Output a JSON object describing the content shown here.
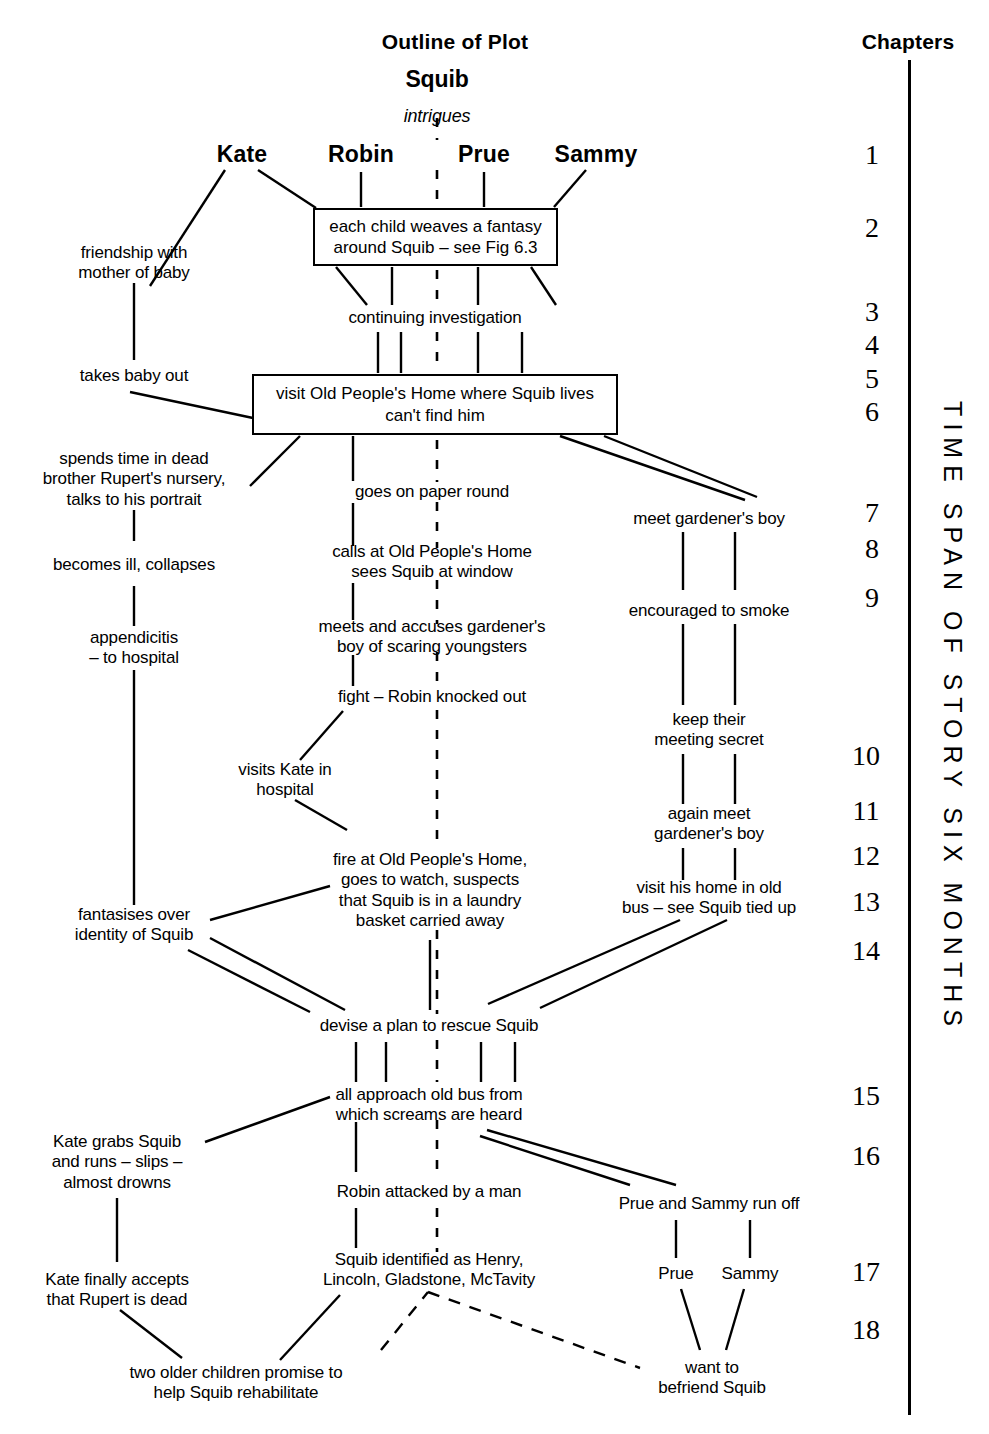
{
  "figure": {
    "title": "Outline of Plot",
    "chapters_heading": "Chapters",
    "central_character": "Squib",
    "central_relation": "intrigues",
    "timespan_label": "TIME SPAN OF STORY SIX MONTHS"
  },
  "characters": [
    {
      "name": "Kate",
      "x": 242,
      "y": 155
    },
    {
      "name": "Robin",
      "x": 361,
      "y": 155
    },
    {
      "name": "Prue",
      "x": 484,
      "y": 155
    },
    {
      "name": "Sammy",
      "x": 596,
      "y": 155
    }
  ],
  "boxes": [
    {
      "id": "box-fantasy",
      "text": "each child weaves a fantasy\naround Squib – see Fig 6.3",
      "x": 313,
      "y": 208,
      "w": 245,
      "h": 58
    },
    {
      "id": "box-visit-home",
      "text": "visit Old People's Home where Squib lives\ncan't find him",
      "x": 252,
      "y": 374,
      "w": 366,
      "h": 61
    }
  ],
  "nodes": [
    {
      "id": "n-continuing",
      "text": "continuing investigation",
      "x": 435,
      "y": 318
    },
    {
      "id": "n-friendship",
      "text": "friendship with\nmother of baby",
      "x": 134,
      "y": 263
    },
    {
      "id": "n-takes-baby",
      "text": "takes baby out",
      "x": 134,
      "y": 376
    },
    {
      "id": "n-nursery",
      "text": "spends time in dead\nbrother Rupert's nursery,\ntalks to his portrait",
      "x": 134,
      "y": 480
    },
    {
      "id": "n-ill",
      "text": "becomes ill, collapses",
      "x": 134,
      "y": 565
    },
    {
      "id": "n-appendicitis",
      "text": "appendicitis\n– to hospital",
      "x": 134,
      "y": 648
    },
    {
      "id": "n-fantasises",
      "text": "fantasises over\nidentity of Squib",
      "x": 134,
      "y": 925
    },
    {
      "id": "n-kate-grabs",
      "text": "Kate grabs Squib\nand runs – slips –\nalmost drowns",
      "x": 117,
      "y": 1163
    },
    {
      "id": "n-kate-accepts",
      "text": "Kate finally accepts\nthat Rupert is dead",
      "x": 117,
      "y": 1290
    },
    {
      "id": "n-paper-round",
      "text": "goes on paper round",
      "x": 432,
      "y": 492
    },
    {
      "id": "n-calls-home",
      "text": "calls at Old People's Home\nsees Squib at window",
      "x": 432,
      "y": 562
    },
    {
      "id": "n-accuses",
      "text": "meets and accuses gardener's\nboy of scaring youngsters",
      "x": 432,
      "y": 637
    },
    {
      "id": "n-fight",
      "text": "fight – Robin knocked out",
      "x": 432,
      "y": 697
    },
    {
      "id": "n-visits-kate",
      "text": "visits Kate in\nhospital",
      "x": 285,
      "y": 780
    },
    {
      "id": "n-fire",
      "text": "fire at Old People's Home,\ngoes to watch, suspects\nthat Squib is in a laundry\nbasket carried away",
      "x": 430,
      "y": 891
    },
    {
      "id": "n-devise",
      "text": "devise a plan to rescue Squib",
      "x": 429,
      "y": 1026
    },
    {
      "id": "n-approach-bus",
      "text": "all approach old bus from\nwhich screams are heard",
      "x": 429,
      "y": 1105
    },
    {
      "id": "n-robin-attacked",
      "text": "Robin attacked by a man",
      "x": 429,
      "y": 1192
    },
    {
      "id": "n-squib-id",
      "text": "Squib identified as Henry,\nLincoln, Gladstone, McTavity",
      "x": 429,
      "y": 1270
    },
    {
      "id": "n-promise",
      "text": "two older children promise to\nhelp Squib rehabilitate",
      "x": 236,
      "y": 1383
    },
    {
      "id": "n-meet-boy",
      "text": "meet gardener's boy",
      "x": 709,
      "y": 519
    },
    {
      "id": "n-smoke",
      "text": "encouraged to smoke",
      "x": 709,
      "y": 611
    },
    {
      "id": "n-secret",
      "text": "keep their\nmeeting secret",
      "x": 709,
      "y": 730
    },
    {
      "id": "n-again-meet",
      "text": "again meet\ngardener's boy",
      "x": 709,
      "y": 824
    },
    {
      "id": "n-visit-bus",
      "text": "visit his home in old\nbus – see Squib tied up",
      "x": 709,
      "y": 898
    },
    {
      "id": "n-run-off",
      "text": "Prue and Sammy run off",
      "x": 709,
      "y": 1204
    },
    {
      "id": "n-prue",
      "text": "Prue",
      "x": 676,
      "y": 1274
    },
    {
      "id": "n-sammy",
      "text": "Sammy",
      "x": 750,
      "y": 1274
    },
    {
      "id": "n-befriend",
      "text": "want to\nbefriend Squib",
      "x": 712,
      "y": 1378
    }
  ],
  "chapters": [
    {
      "num": "1",
      "x": 872,
      "y": 155
    },
    {
      "num": "2",
      "x": 872,
      "y": 228
    },
    {
      "num": "3",
      "x": 872,
      "y": 312
    },
    {
      "num": "4",
      "x": 872,
      "y": 345
    },
    {
      "num": "5",
      "x": 872,
      "y": 379
    },
    {
      "num": "6",
      "x": 872,
      "y": 412
    },
    {
      "num": "7",
      "x": 872,
      "y": 513
    },
    {
      "num": "8",
      "x": 872,
      "y": 549
    },
    {
      "num": "9",
      "x": 872,
      "y": 598
    },
    {
      "num": "10",
      "x": 866,
      "y": 756
    },
    {
      "num": "11",
      "x": 866,
      "y": 811
    },
    {
      "num": "12",
      "x": 866,
      "y": 856
    },
    {
      "num": "13",
      "x": 866,
      "y": 902
    },
    {
      "num": "14",
      "x": 866,
      "y": 951
    },
    {
      "num": "15",
      "x": 866,
      "y": 1096
    },
    {
      "num": "16",
      "x": 866,
      "y": 1156
    },
    {
      "num": "17",
      "x": 866,
      "y": 1272
    },
    {
      "num": "18",
      "x": 866,
      "y": 1330
    }
  ],
  "colors": {
    "ink": "#000000",
    "paper": "#ffffff"
  }
}
